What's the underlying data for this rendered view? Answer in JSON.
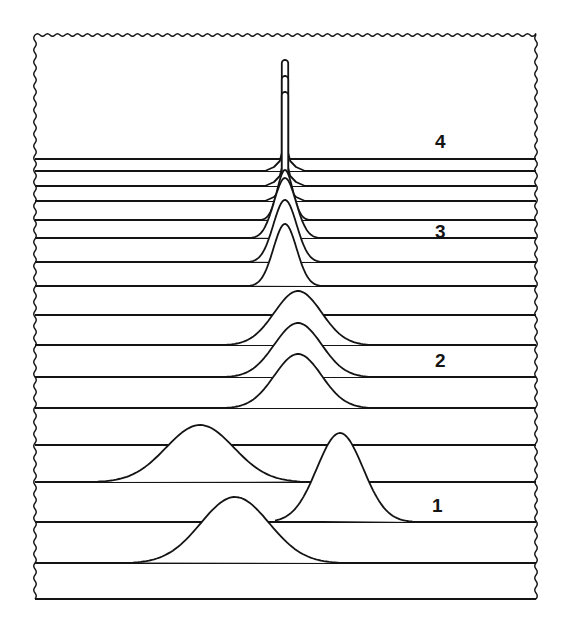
{
  "figure": {
    "colors": {
      "ink": "#141414",
      "fill": "#ffffff",
      "background": "#ffffff"
    },
    "frame": {
      "left": 35,
      "top": 35,
      "right": 536,
      "bottom": 599
    },
    "baselines": [
      159,
      171,
      186,
      201,
      220,
      238,
      262,
      286,
      315,
      345,
      377,
      408,
      445,
      482,
      522,
      563,
      599
    ],
    "curves": [
      {
        "group": "1",
        "baseline": 563,
        "left": 133,
        "right": 345,
        "peak_x": 235,
        "peak_y": 497
      },
      {
        "group": "1",
        "baseline": 522,
        "left": 275,
        "right": 418,
        "peak_x": 340,
        "peak_y": 433
      },
      {
        "group": "1",
        "baseline": 482,
        "left": 90,
        "right": 300,
        "peak_x": 200,
        "peak_y": 425
      },
      {
        "group": "2",
        "baseline": 408,
        "left": 226,
        "right": 372,
        "peak_x": 298,
        "peak_y": 354
      },
      {
        "group": "2",
        "baseline": 377,
        "left": 226,
        "right": 372,
        "peak_x": 298,
        "peak_y": 323
      },
      {
        "group": "2",
        "baseline": 345,
        "left": 226,
        "right": 372,
        "peak_x": 298,
        "peak_y": 291
      },
      {
        "group": "3",
        "baseline": 286,
        "left": 250,
        "right": 322,
        "peak_x": 285,
        "peak_y": 224
      },
      {
        "group": "3",
        "baseline": 262,
        "left": 250,
        "right": 322,
        "peak_x": 285,
        "peak_y": 200
      },
      {
        "group": "3",
        "baseline": 238,
        "left": 252,
        "right": 320,
        "peak_x": 285,
        "peak_y": 178
      },
      {
        "group": "3",
        "baseline": 220,
        "left": 262,
        "right": 310,
        "peak_x": 285,
        "peak_y": 170
      },
      {
        "group": "4",
        "baseline": 201,
        "left": 266,
        "right": 306,
        "peak_x": 285,
        "peak_y": 92
      },
      {
        "group": "4",
        "baseline": 186,
        "left": 266,
        "right": 306,
        "peak_x": 285,
        "peak_y": 76
      },
      {
        "group": "4",
        "baseline": 171,
        "left": 266,
        "right": 306,
        "peak_x": 285,
        "peak_y": 60
      }
    ],
    "labels": [
      {
        "text": "4",
        "x": 435,
        "y": 132
      },
      {
        "text": "3",
        "x": 435,
        "y": 222
      },
      {
        "text": "2",
        "x": 435,
        "y": 351
      },
      {
        "text": "1",
        "x": 432,
        "y": 496
      }
    ]
  }
}
